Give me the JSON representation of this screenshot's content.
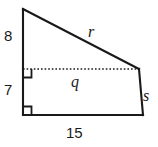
{
  "figure": {
    "kind": "geometry-diagram",
    "background_color": "#ffffff",
    "stroke_color": "#1a1a1a",
    "labels": {
      "left_upper": "8",
      "left_lower": "7",
      "base": "15",
      "hypotenuse": "r",
      "divider": "q",
      "right_side": "s"
    },
    "vertices": {
      "top_left": [
        23,
        9
      ],
      "divider_left": [
        23,
        69
      ],
      "divider_right": [
        139,
        69
      ],
      "bottom_right": [
        143,
        115
      ],
      "bottom_left": [
        23,
        115
      ]
    },
    "right_angle_marks": [
      {
        "name": "divider-left-right-angle",
        "x": 23,
        "y": 69
      },
      {
        "name": "bottom-left-right-angle",
        "x": 23,
        "y": 115
      }
    ]
  }
}
